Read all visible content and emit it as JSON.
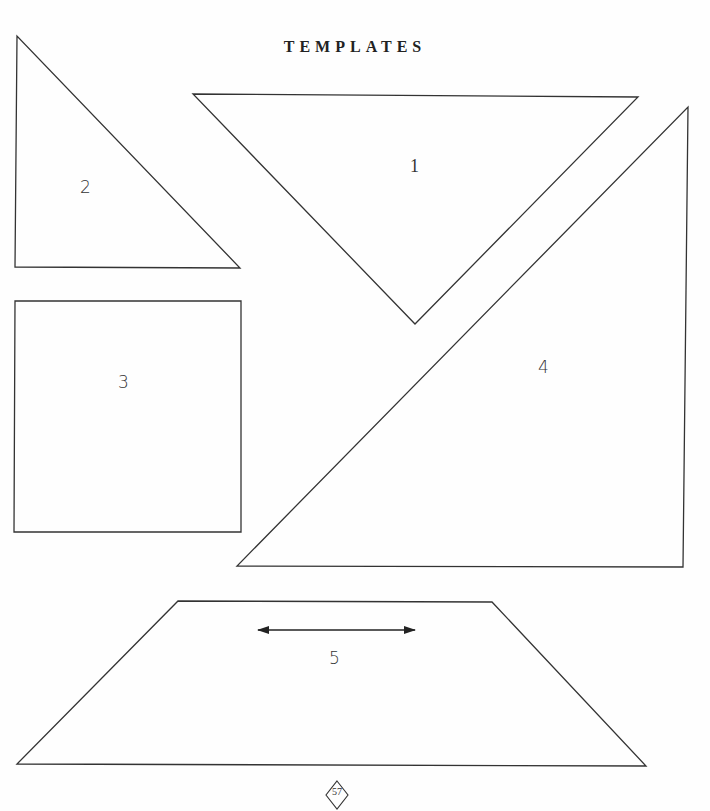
{
  "page": {
    "title": "Templates",
    "page_number": "57"
  },
  "templates": [
    {
      "id": "1",
      "label": "1",
      "shape": "triangle",
      "points": [
        [
          193,
          94
        ],
        [
          638,
          97
        ],
        [
          415,
          324
        ]
      ],
      "label_pos": [
        410,
        156
      ]
    },
    {
      "id": "2",
      "label": "2",
      "shape": "triangle",
      "points": [
        [
          17,
          36
        ],
        [
          15,
          267
        ],
        [
          240,
          268
        ]
      ],
      "label_pos": [
        80,
        177
      ]
    },
    {
      "id": "3",
      "label": "3",
      "shape": "square",
      "points": [
        [
          15,
          301
        ],
        [
          241,
          301
        ],
        [
          241,
          532
        ],
        [
          14,
          532
        ]
      ],
      "label_pos": [
        118,
        372
      ]
    },
    {
      "id": "4",
      "label": "4",
      "shape": "triangle",
      "points": [
        [
          688,
          107
        ],
        [
          683,
          567
        ],
        [
          237,
          566
        ]
      ],
      "label_pos": [
        538,
        357
      ]
    },
    {
      "id": "5",
      "label": "5",
      "shape": "trapezoid",
      "points": [
        [
          178,
          601
        ],
        [
          492,
          602
        ],
        [
          646,
          766
        ],
        [
          17,
          764
        ]
      ],
      "label_pos": [
        329,
        648
      ],
      "grain_arrow": {
        "x1": 257,
        "x2": 416,
        "y": 630
      }
    }
  ],
  "colors": {
    "line": "#333333",
    "background": "#fefefe"
  }
}
